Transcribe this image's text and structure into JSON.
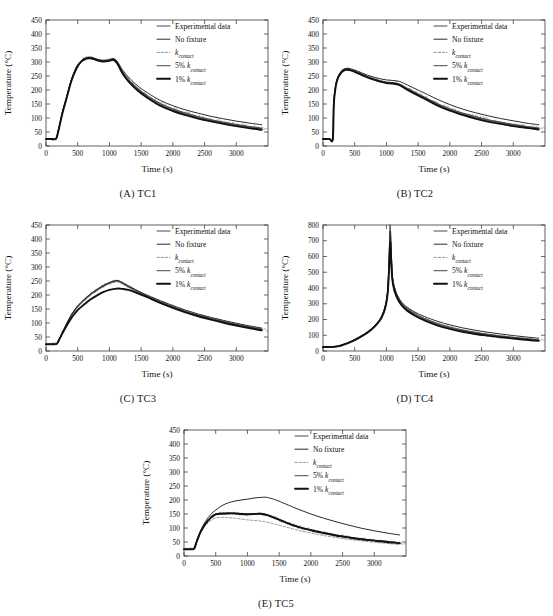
{
  "header": {
    "left": "",
    "right": ""
  },
  "axes": {
    "xlabel": "Time (s)",
    "ylabel": "Temperature (°C)",
    "xticks": [
      0,
      500,
      1000,
      1500,
      2000,
      2500,
      3000
    ],
    "xlim": [
      0,
      3500
    ],
    "yticks_450": [
      0,
      50,
      100,
      150,
      200,
      250,
      300,
      350,
      400,
      450
    ],
    "ylim_450": [
      0,
      450
    ],
    "yticks_800": [
      0,
      100,
      200,
      300,
      400,
      500,
      600,
      700,
      800
    ],
    "ylim_800": [
      0,
      800
    ]
  },
  "legend": {
    "items": [
      {
        "label": "Experimental data",
        "sub": "",
        "style": "solid",
        "width": 1.0,
        "color": "#4a4a4a"
      },
      {
        "label": "No fixture",
        "sub": "",
        "style": "solid",
        "width": 1.0,
        "color": "#2a2a2a"
      },
      {
        "label": "k",
        "sub": "contact",
        "style": "dashed",
        "width": 0.9,
        "color": "#8a8a8a"
      },
      {
        "label": "5% k",
        "sub": "contact",
        "style": "solid",
        "width": 1.3,
        "color": "#6a6a6a"
      },
      {
        "label": "1% k",
        "sub": "contact",
        "style": "solid",
        "width": 1.9,
        "color": "#111111"
      }
    ]
  },
  "panels": [
    {
      "id": "A",
      "caption": "(A)  TC1",
      "thermocouple": "TC1"
    },
    {
      "id": "B",
      "caption": "(B)  TC2",
      "thermocouple": "TC2"
    },
    {
      "id": "C",
      "caption": "(C)  TC3",
      "thermocouple": "TC3"
    },
    {
      "id": "D",
      "caption": "(D)  TC4",
      "thermocouple": "TC4"
    },
    {
      "id": "E",
      "caption": "(E)  TC5",
      "thermocouple": "TC5"
    }
  ],
  "chart_data": [
    {
      "type": "line",
      "panel": "A",
      "title": "(A)  TC1",
      "xlabel": "Time (s)",
      "ylabel": "Temperature (°C)",
      "xlim": [
        0,
        3500
      ],
      "ylim": [
        0,
        450
      ],
      "grid": false,
      "legend_position": "upper right",
      "x": [
        0,
        100,
        160,
        200,
        260,
        320,
        400,
        480,
        560,
        640,
        700,
        760,
        820,
        900,
        1000,
        1060,
        1120,
        1200,
        1300,
        1450,
        1600,
        1800,
        2000,
        2200,
        2400,
        2600,
        2800,
        3000,
        3200,
        3400
      ],
      "series": [
        {
          "name": "Experimental data",
          "values": [
            25,
            25,
            26,
            60,
            120,
            170,
            235,
            280,
            305,
            315,
            316,
            313,
            308,
            305,
            307,
            311,
            300,
            268,
            238,
            205,
            180,
            152,
            133,
            118,
            105,
            94,
            85,
            77,
            70,
            64
          ]
        },
        {
          "name": "No fixture",
          "values": [
            25,
            25,
            26,
            62,
            122,
            172,
            237,
            282,
            306,
            316,
            317,
            314,
            309,
            306,
            308,
            312,
            303,
            274,
            246,
            214,
            190,
            163,
            144,
            129,
            117,
            106,
            97,
            89,
            82,
            76
          ]
        },
        {
          "name": "k_contact",
          "values": [
            25,
            25,
            26,
            59,
            119,
            168,
            233,
            278,
            303,
            313,
            314,
            311,
            306,
            303,
            305,
            309,
            297,
            264,
            233,
            200,
            175,
            147,
            128,
            113,
            100,
            90,
            81,
            73,
            66,
            60
          ]
        },
        {
          "name": "5% k_contact",
          "values": [
            25,
            25,
            26,
            60,
            120,
            169,
            234,
            279,
            304,
            314,
            315,
            312,
            307,
            304,
            306,
            310,
            299,
            266,
            236,
            203,
            178,
            150,
            131,
            116,
            103,
            92,
            83,
            75,
            68,
            62
          ]
        },
        {
          "name": "1% k_contact",
          "values": [
            25,
            25,
            26,
            58,
            118,
            167,
            232,
            277,
            302,
            312,
            313,
            310,
            305,
            302,
            304,
            308,
            296,
            262,
            231,
            197,
            172,
            144,
            125,
            110,
            98,
            88,
            79,
            71,
            64,
            58
          ]
        }
      ]
    },
    {
      "type": "line",
      "panel": "B",
      "title": "(B)  TC2",
      "xlabel": "Time (s)",
      "ylabel": "Temperature (°C)",
      "xlim": [
        0,
        3500
      ],
      "ylim": [
        0,
        450
      ],
      "grid": false,
      "legend_position": "upper right",
      "x": [
        0,
        100,
        155,
        170,
        200,
        240,
        300,
        360,
        420,
        500,
        600,
        700,
        800,
        900,
        1000,
        1100,
        1200,
        1300,
        1450,
        1600,
        1800,
        2000,
        2200,
        2400,
        2600,
        2800,
        3000,
        3200,
        3400
      ],
      "series": [
        {
          "name": "Experimental data",
          "values": [
            25,
            25,
            25,
            150,
            215,
            248,
            268,
            275,
            274,
            268,
            258,
            248,
            240,
            233,
            228,
            226,
            222,
            210,
            192,
            175,
            152,
            133,
            118,
            105,
            94,
            85,
            77,
            70,
            64
          ]
        },
        {
          "name": "No fixture",
          "values": [
            25,
            25,
            25,
            152,
            217,
            250,
            270,
            277,
            276,
            271,
            262,
            253,
            246,
            240,
            236,
            234,
            231,
            221,
            205,
            189,
            167,
            148,
            132,
            119,
            108,
            98,
            90,
            82,
            76
          ]
        },
        {
          "name": "k_contact",
          "values": [
            25,
            25,
            25,
            148,
            213,
            246,
            266,
            273,
            272,
            266,
            256,
            246,
            238,
            231,
            226,
            224,
            219,
            207,
            188,
            171,
            148,
            129,
            114,
            101,
            90,
            81,
            74,
            67,
            61
          ]
        },
        {
          "name": "5% k_contact",
          "values": [
            25,
            25,
            25,
            149,
            214,
            247,
            267,
            274,
            273,
            267,
            257,
            247,
            239,
            232,
            227,
            225,
            220,
            208,
            190,
            173,
            150,
            131,
            116,
            103,
            92,
            83,
            76,
            69,
            63
          ]
        },
        {
          "name": "1% k_contact",
          "values": [
            25,
            25,
            25,
            147,
            212,
            245,
            265,
            272,
            271,
            265,
            255,
            245,
            237,
            230,
            225,
            223,
            218,
            205,
            186,
            169,
            145,
            126,
            111,
            98,
            87,
            79,
            71,
            65,
            59
          ]
        }
      ]
    },
    {
      "type": "line",
      "panel": "C",
      "title": "(C)  TC3",
      "xlabel": "Time (s)",
      "ylabel": "Temperature (°C)",
      "xlim": [
        0,
        3500
      ],
      "ylim": [
        0,
        450
      ],
      "grid": false,
      "legend_position": "upper right",
      "x": [
        0,
        100,
        170,
        220,
        300,
        400,
        500,
        600,
        700,
        800,
        900,
        1000,
        1080,
        1140,
        1200,
        1300,
        1450,
        1600,
        1800,
        2000,
        2200,
        2400,
        2600,
        2800,
        3000,
        3200,
        3400
      ],
      "series": [
        {
          "name": "Experimental data",
          "values": [
            24,
            24,
            26,
            48,
            85,
            128,
            160,
            182,
            202,
            218,
            232,
            243,
            249,
            250,
            243,
            230,
            212,
            196,
            176,
            158,
            142,
            128,
            116,
            105,
            95,
            86,
            78
          ]
        },
        {
          "name": "No fixture",
          "values": [
            24,
            24,
            26,
            48,
            86,
            129,
            161,
            184,
            204,
            220,
            234,
            245,
            251,
            252,
            245,
            233,
            215,
            199,
            180,
            162,
            146,
            132,
            120,
            109,
            99,
            90,
            82
          ]
        },
        {
          "name": "k_contact",
          "values": [
            24,
            24,
            26,
            47,
            84,
            126,
            158,
            180,
            200,
            216,
            230,
            241,
            247,
            248,
            241,
            228,
            210,
            194,
            174,
            156,
            140,
            126,
            114,
            103,
            93,
            84,
            76
          ]
        },
        {
          "name": "5% k_contact",
          "values": [
            24,
            24,
            26,
            47,
            85,
            127,
            159,
            181,
            201,
            217,
            231,
            242,
            248,
            249,
            242,
            229,
            211,
            195,
            175,
            157,
            141,
            127,
            115,
            104,
            94,
            85,
            77
          ]
        },
        {
          "name": "1% k_contact",
          "values": [
            24,
            24,
            26,
            46,
            80,
            118,
            146,
            166,
            184,
            198,
            210,
            218,
            222,
            223,
            222,
            218,
            206,
            192,
            172,
            154,
            138,
            124,
            112,
            101,
            91,
            82,
            74
          ]
        }
      ]
    },
    {
      "type": "line",
      "panel": "D",
      "title": "(D)  TC4",
      "xlabel": "Time (s)",
      "ylabel": "Temperature (°C)",
      "xlim": [
        0,
        3500
      ],
      "ylim": [
        0,
        800
      ],
      "grid": false,
      "legend_position": "upper right",
      "x": [
        0,
        150,
        250,
        350,
        450,
        550,
        650,
        750,
        850,
        920,
        980,
        1020,
        1045,
        1060,
        1090,
        1130,
        1200,
        1300,
        1450,
        1600,
        1800,
        2000,
        2200,
        2400,
        2600,
        2800,
        3000,
        3200,
        3400
      ],
      "series": [
        {
          "name": "Experimental data",
          "values": [
            25,
            26,
            32,
            45,
            62,
            82,
            106,
            135,
            175,
            215,
            280,
            380,
            620,
            800,
            500,
            400,
            330,
            280,
            238,
            208,
            176,
            152,
            134,
            119,
            107,
            96,
            87,
            79,
            71
          ]
        },
        {
          "name": "No fixture",
          "values": [
            25,
            26,
            32,
            45,
            62,
            83,
            107,
            137,
            177,
            218,
            284,
            386,
            600,
            760,
            490,
            398,
            332,
            286,
            247,
            219,
            189,
            166,
            147,
            132,
            119,
            108,
            98,
            89,
            81
          ]
        },
        {
          "name": "k_contact",
          "values": [
            25,
            26,
            31,
            44,
            61,
            81,
            104,
            133,
            172,
            211,
            274,
            372,
            560,
            700,
            470,
            383,
            318,
            270,
            229,
            199,
            168,
            145,
            127,
            113,
            101,
            91,
            82,
            74,
            67
          ]
        },
        {
          "name": "5% k_contact",
          "values": [
            25,
            26,
            31,
            44,
            61,
            81,
            105,
            134,
            173,
            213,
            277,
            375,
            575,
            720,
            476,
            388,
            322,
            273,
            232,
            202,
            171,
            147,
            129,
            115,
            103,
            93,
            84,
            76,
            69
          ]
        },
        {
          "name": "1% k_contact",
          "values": [
            25,
            26,
            31,
            43,
            60,
            80,
            103,
            131,
            170,
            209,
            271,
            368,
            548,
            690,
            465,
            378,
            313,
            265,
            224,
            194,
            163,
            140,
            122,
            108,
            97,
            87,
            79,
            71,
            64
          ]
        }
      ]
    },
    {
      "type": "line",
      "panel": "E",
      "title": "(E)  TC5",
      "xlabel": "Time (s)",
      "ylabel": "Temperature (°C)",
      "xlim": [
        0,
        3500
      ],
      "ylim": [
        0,
        450
      ],
      "grid": false,
      "legend_position": "upper right",
      "x": [
        0,
        100,
        160,
        200,
        260,
        340,
        420,
        500,
        600,
        700,
        800,
        900,
        1000,
        1100,
        1200,
        1280,
        1350,
        1450,
        1600,
        1800,
        2000,
        2200,
        2400,
        2600,
        2800,
        3000,
        3200,
        3400
      ],
      "series": [
        {
          "name": "Experimental data",
          "values": [
            24,
            24,
            26,
            52,
            85,
            115,
            135,
            150,
            152,
            153,
            152,
            150,
            149,
            150,
            151,
            148,
            143,
            134,
            120,
            104,
            92,
            82,
            73,
            66,
            60,
            55,
            50,
            46
          ]
        },
        {
          "name": "No fixture",
          "values": [
            24,
            24,
            26,
            54,
            90,
            124,
            148,
            164,
            180,
            190,
            196,
            200,
            203,
            207,
            209,
            210,
            207,
            200,
            186,
            167,
            150,
            135,
            122,
            110,
            99,
            90,
            82,
            75
          ]
        },
        {
          "name": "k_contact",
          "values": [
            24,
            24,
            26,
            50,
            82,
            110,
            126,
            136,
            138,
            137,
            135,
            132,
            129,
            127,
            125,
            122,
            119,
            113,
            104,
            92,
            82,
            73,
            66,
            59,
            54,
            49,
            45,
            41
          ]
        },
        {
          "name": "5% k_contact",
          "values": [
            24,
            24,
            26,
            52,
            86,
            116,
            137,
            150,
            152,
            153,
            153,
            151,
            150,
            151,
            152,
            149,
            144,
            135,
            121,
            105,
            93,
            83,
            74,
            67,
            61,
            56,
            51,
            47
          ]
        },
        {
          "name": "1% k_contact",
          "values": [
            24,
            24,
            26,
            51,
            85,
            115,
            136,
            149,
            151,
            152,
            152,
            150,
            149,
            150,
            151,
            148,
            143,
            134,
            120,
            104,
            92,
            82,
            73,
            66,
            60,
            55,
            50,
            46
          ]
        }
      ]
    }
  ]
}
